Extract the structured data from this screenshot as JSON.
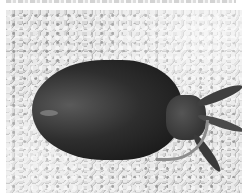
{
  "image": {
    "description": "Grayscale photo of a cuttlefish lying on gravel",
    "caption_fragment": "",
    "subject": "cuttlefish",
    "background": "gravel",
    "colors": {
      "gravel": "#cfcfcf",
      "body": "#1c1c1c",
      "arms": "#3f3f3f"
    }
  }
}
